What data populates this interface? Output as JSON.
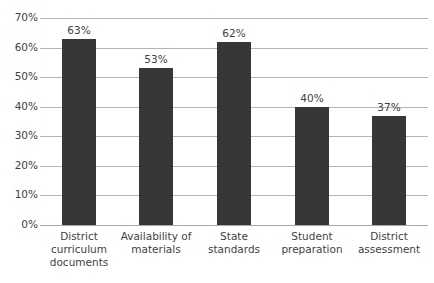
{
  "chart_data": {
    "type": "bar",
    "title": "",
    "subtitle": "",
    "xlabel": "",
    "ylabel": "",
    "categories": [
      "District curriculum documents",
      "Availability of materials",
      "State standards",
      "Student preparation",
      "District assessment"
    ],
    "category_lines": [
      [
        "District",
        "curriculum",
        "documents"
      ],
      [
        "Availability of",
        "materials"
      ],
      [
        "State",
        "standards"
      ],
      [
        "Student",
        "preparation"
      ],
      [
        "District",
        "assessment"
      ]
    ],
    "values": [
      63,
      53,
      62,
      40,
      37
    ],
    "data_labels": [
      "63%",
      "53%",
      "62%",
      "40%",
      "37%"
    ],
    "ylim": [
      0,
      70
    ],
    "ytick_values": [
      0,
      10,
      20,
      30,
      40,
      50,
      60,
      70
    ],
    "ytick_labels": [
      "0%",
      "10%",
      "20%",
      "30%",
      "40%",
      "50%",
      "60%",
      "70%"
    ],
    "grid": "horizontal",
    "legend": "none",
    "series": [
      {
        "name": "Percent",
        "values": [
          63,
          53,
          62,
          40,
          37
        ]
      }
    ],
    "colors": {
      "bar": "#373737",
      "gridline": "#b4b4b4",
      "baseline": "#a8a8a8",
      "text": "#3f3f3f",
      "background": "#ffffff"
    }
  }
}
